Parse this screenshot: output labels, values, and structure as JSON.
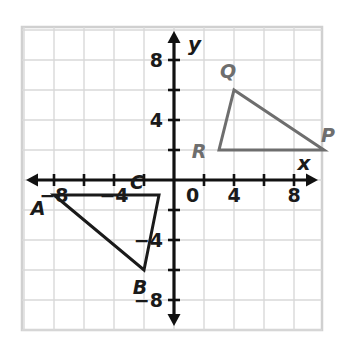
{
  "figure": {
    "type": "coordinate-plane-graph",
    "background_color": "#ffffff",
    "frame_color": "#d0d0d0",
    "grid_color": "#d9d9d9",
    "axis_color": "#111111"
  },
  "axes": {
    "x_name": "x",
    "y_name": "y",
    "origin_label": "0",
    "xlim": [
      -10,
      10
    ],
    "ylim": [
      -10,
      10
    ],
    "tick_step": 2,
    "x_tick_labels": [
      {
        "value": -8,
        "text": "−8"
      },
      {
        "value": -4,
        "text": "−4"
      },
      {
        "value": 4,
        "text": "4"
      },
      {
        "value": 8,
        "text": "8"
      }
    ],
    "y_tick_labels": [
      {
        "value": 8,
        "text": "8"
      },
      {
        "value": 4,
        "text": "4"
      },
      {
        "value": -4,
        "text": "−4"
      },
      {
        "value": -8,
        "text": "−8"
      }
    ]
  },
  "chart_data": {
    "type": "scatter",
    "title": "",
    "xlabel": "x",
    "ylabel": "y",
    "xlim": [
      -10,
      10
    ],
    "ylim": [
      -10,
      10
    ],
    "grid": true,
    "legend": "none",
    "shapes": [
      {
        "name": "triangle-abc",
        "stroke": "#1a1a1a",
        "stroke_width": 3,
        "fill": "none",
        "vertices": [
          {
            "label": "A",
            "x": -8,
            "y": -1,
            "label_dx": -16,
            "label_dy": 20
          },
          {
            "label": "B",
            "x": -2,
            "y": -6,
            "label_dx": -4,
            "label_dy": 24
          },
          {
            "label": "C",
            "x": -1,
            "y": -1,
            "label_dx": -22,
            "label_dy": -6
          }
        ]
      },
      {
        "name": "triangle-pqr",
        "stroke": "#6e6e6e",
        "stroke_width": 3,
        "fill": "none",
        "vertices": [
          {
            "label": "P",
            "x": 10,
            "y": 2,
            "label_dx": 4,
            "label_dy": -8
          },
          {
            "label": "Q",
            "x": 4,
            "y": 6,
            "label_dx": -6,
            "label_dy": -12
          },
          {
            "label": "R",
            "x": 3,
            "y": 2,
            "label_dx": -20,
            "label_dy": 8
          }
        ]
      }
    ]
  }
}
